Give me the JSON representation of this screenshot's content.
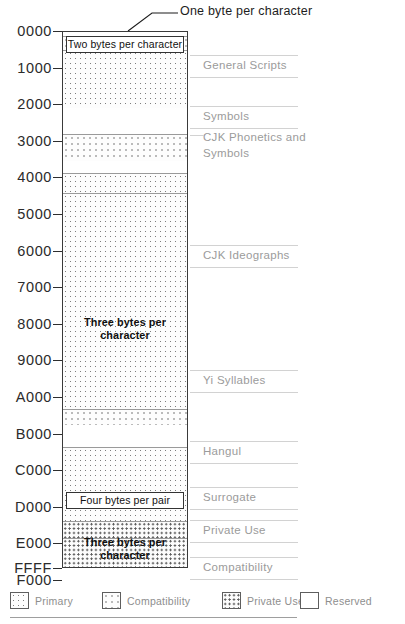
{
  "diagram": {
    "callout": {
      "text": "One byte per character",
      "target_label": "ascii-band"
    },
    "axis": {
      "unit": "hex code point",
      "ticks": [
        "0000",
        "1000",
        "2000",
        "3000",
        "4000",
        "5000",
        "6000",
        "7000",
        "8000",
        "9000",
        "A000",
        "B000",
        "C000",
        "D000",
        "E000",
        "F000",
        "FFFF"
      ]
    },
    "encoding_labels": [
      {
        "name": "two-bytes",
        "text": "Two bytes per character",
        "boxed": true
      },
      {
        "name": "three-bytes-main",
        "text": "Three bytes\nper character",
        "boxed": false
      },
      {
        "name": "four-bytes-pair",
        "text": "Four bytes per pair",
        "boxed": true
      },
      {
        "name": "three-bytes-private",
        "text": "Three bytes\nper character",
        "boxed": false
      }
    ],
    "regions": [
      {
        "name": "general-scripts",
        "label": "General Scripts"
      },
      {
        "name": "symbols",
        "label": "Symbols"
      },
      {
        "name": "cjk-phonetics",
        "label": "CJK Phonetics and\nSymbols"
      },
      {
        "name": "cjk-ideographs",
        "label": "CJK Ideographs"
      },
      {
        "name": "yi-syllables",
        "label": "Yi Syllables"
      },
      {
        "name": "hangul",
        "label": "Hangul"
      },
      {
        "name": "surrogate",
        "label": "Surrogate"
      },
      {
        "name": "private-use",
        "label": "Private Use"
      },
      {
        "name": "compatibility",
        "label": "Compatibility"
      }
    ],
    "legend": [
      {
        "name": "primary",
        "label": "Primary",
        "fill": "primary"
      },
      {
        "name": "compatibility",
        "label": "Compatibility",
        "fill": "compat"
      },
      {
        "name": "private-use",
        "label": "Private Use",
        "fill": "private"
      },
      {
        "name": "reserved",
        "label": "Reserved",
        "fill": "reserved"
      }
    ],
    "colors": {
      "ink": "#2b2b2b",
      "region_text": "#9b9b9b",
      "frame": "#3a3a3a",
      "leader": "#d2d2d2"
    }
  },
  "chart_data": {
    "type": "bar",
    "orientation": "vertical-codespace",
    "xlabel": "",
    "ylabel": "Code point (hex)",
    "ylim": [
      "0000",
      "FFFF"
    ],
    "grid": false,
    "axis_ticks": [
      "0000",
      "1000",
      "2000",
      "3000",
      "4000",
      "5000",
      "6000",
      "7000",
      "8000",
      "9000",
      "A000",
      "B000",
      "C000",
      "D000",
      "E000",
      "F000",
      "FFFF"
    ],
    "legend_position": "bottom",
    "bands": [
      {
        "name": "ascii-band",
        "label": "",
        "fill": "reserved",
        "start": "0000",
        "end": "0080",
        "top_px": 0,
        "height_px": 4
      },
      {
        "name": "two-byte-band",
        "label": "",
        "fill": "compat",
        "start": "0080",
        "end": "0250",
        "top_px": 4,
        "height_px": 14
      },
      {
        "name": "general-scripts",
        "label": "General Scripts",
        "fill": "primary",
        "start": "0250",
        "end": "1700",
        "top_px": 18,
        "height_px": 58
      },
      {
        "name": "reserved-1",
        "label": "",
        "fill": "reserved",
        "start": "1700",
        "end": "2000",
        "top_px": 76,
        "height_px": 26
      },
      {
        "name": "symbols",
        "label": "Symbols",
        "fill": "compat",
        "start": "2000",
        "end": "2800",
        "top_px": 102,
        "height_px": 27
      },
      {
        "name": "reserved-2",
        "label": "",
        "fill": "reserved",
        "start": "2800",
        "end": "2E00",
        "top_px": 129,
        "height_px": 12
      },
      {
        "name": "cjk-phonetics",
        "label": "CJK Phonetics and Symbols",
        "fill": "primary",
        "start": "2E00",
        "end": "3400",
        "top_px": 141,
        "height_px": 20
      },
      {
        "name": "cjk-ideographs",
        "label": "CJK Ideographs",
        "fill": "primary",
        "start": "3400",
        "end": "A000",
        "top_px": 161,
        "height_px": 216
      },
      {
        "name": "yi-syllables",
        "label": "Yi Syllables",
        "fill": "compat",
        "start": "A000",
        "end": "A4D0",
        "top_px": 377,
        "height_px": 16
      },
      {
        "name": "reserved-3",
        "label": "",
        "fill": "reserved",
        "start": "A4D0",
        "end": "AC00",
        "top_px": 393,
        "height_px": 22
      },
      {
        "name": "hangul",
        "label": "Hangul",
        "fill": "primary",
        "start": "AC00",
        "end": "D800",
        "top_px": 415,
        "height_px": 74
      },
      {
        "name": "surrogate",
        "label": "Surrogate",
        "fill": "private",
        "start": "D800",
        "end": "E000",
        "top_px": 489,
        "height_px": 17
      },
      {
        "name": "private-use",
        "label": "Private Use",
        "fill": "private",
        "start": "E000",
        "end": "F900",
        "top_px": 506,
        "height_px": 49
      },
      {
        "name": "compatibility",
        "label": "Compatibility",
        "fill": "compat",
        "start": "F900",
        "end": "FFFF",
        "top_px": 555,
        "height_px": 30
      }
    ]
  },
  "layout": {
    "column": {
      "left": 62,
      "top": 31,
      "width": 126,
      "height": 537
    },
    "tick_positions": [
      31,
      67.6,
      104.2,
      140.8,
      177.4,
      214,
      250.6,
      287.2,
      323.8,
      360.4,
      397,
      433.6,
      470.2,
      506.8,
      543.4,
      580,
      568
    ],
    "region_label_y": [
      66,
      117,
      146,
      256,
      381,
      452,
      498,
      531,
      568
    ],
    "encoding_label_y": [
      36,
      316,
      492,
      536
    ],
    "legend_x": [
      0,
      92,
      212,
      290
    ]
  }
}
